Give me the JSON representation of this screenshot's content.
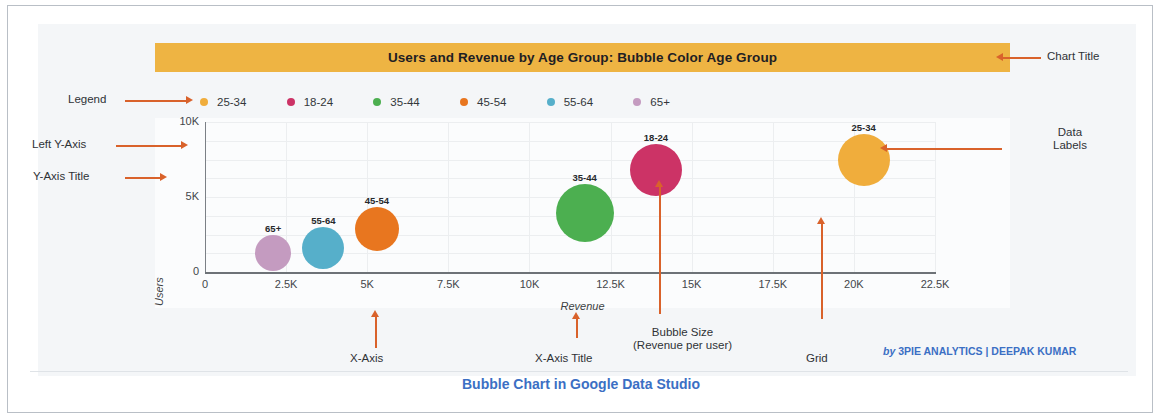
{
  "chart_data": {
    "type": "scatter",
    "title": "Users and Revenue by Age Group: Bubble Color Age Group",
    "xlabel": "Revenue",
    "ylabel": "Users",
    "xlim": [
      0,
      22500
    ],
    "ylim": [
      0,
      10000
    ],
    "xticks": [
      "0",
      "2.5K",
      "5K",
      "7.5K",
      "10K",
      "12.5K",
      "15K",
      "17.5K",
      "20K",
      "22.5K"
    ],
    "xtick_values": [
      0,
      2500,
      5000,
      7500,
      10000,
      12500,
      15000,
      17500,
      20000,
      22500
    ],
    "yticks": [
      "0",
      "5K",
      "10K"
    ],
    "ytick_values": [
      0,
      5000,
      10000
    ],
    "grid": true,
    "legend_position": "top-left",
    "size_encodes": "Revenue per user",
    "points": [
      {
        "label": "65+",
        "x": 2100,
        "y": 1300,
        "size": 18,
        "color": "#c49bc0"
      },
      {
        "label": "55-64",
        "x": 3650,
        "y": 1600,
        "size": 21,
        "color": "#56afca"
      },
      {
        "label": "45-54",
        "x": 5300,
        "y": 2900,
        "size": 22,
        "color": "#e8761f"
      },
      {
        "label": "35-44",
        "x": 11700,
        "y": 3950,
        "size": 29,
        "color": "#4caf50"
      },
      {
        "label": "18-24",
        "x": 13900,
        "y": 6800,
        "size": 26,
        "color": "#cc3366"
      },
      {
        "label": "25-34",
        "x": 20300,
        "y": 7500,
        "size": 26,
        "color": "#f0ad3c"
      }
    ],
    "legend": [
      {
        "label": "25-34",
        "color": "#f0ad3c"
      },
      {
        "label": "18-24",
        "color": "#cc3366"
      },
      {
        "label": "35-44",
        "color": "#4caf50"
      },
      {
        "label": "45-54",
        "color": "#e8761f"
      },
      {
        "label": "55-64",
        "color": "#56afca"
      },
      {
        "label": "65+",
        "color": "#c49bc0"
      }
    ]
  },
  "annotations": {
    "chart_title": "Chart Title",
    "legend": "Legend",
    "left_y_axis": "Left Y-Axis",
    "y_axis_title": "Y-Axis Title",
    "data_labels_line1": "Data",
    "data_labels_line2": "Labels",
    "x_axis": "X-Axis",
    "x_axis_title": "X-Axis Title",
    "bubble_size_line1": "Bubble Size",
    "bubble_size_line2": "(Revenue per user)",
    "grid": "Grid"
  },
  "credit": {
    "prefix": "by",
    "text": "3PIE ANALYTICS | DEEPAK KUMAR"
  },
  "caption": "Bubble Chart in Google Data Studio",
  "colors": {
    "title_bar": "#eeb443",
    "annotation_arrow": "#d9622b",
    "caption_blue": "#3b6fc4"
  }
}
